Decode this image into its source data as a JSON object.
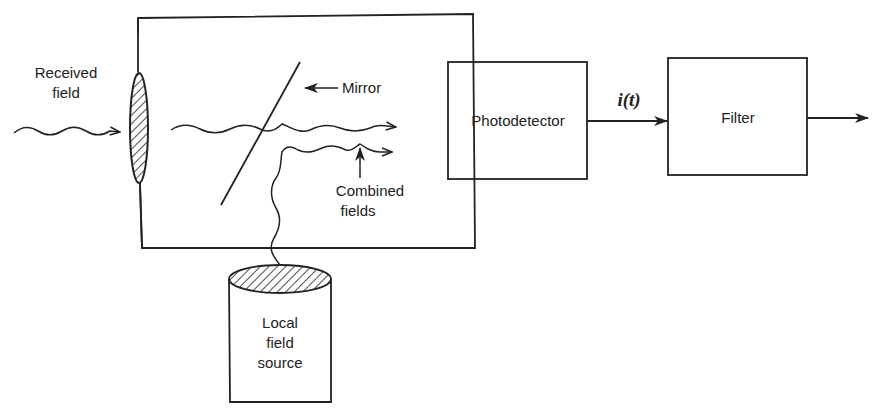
{
  "diagram": {
    "type": "block-diagram",
    "colors": {
      "line": "#222222",
      "background": "#ffffff"
    },
    "labels": {
      "received_field_line1": "Received",
      "received_field_line2": "field",
      "mirror": "Mirror",
      "combined_fields_line1": "Combined",
      "combined_fields_line2": "fields",
      "local_source_line1": "Local",
      "local_source_line2": "field",
      "local_source_line3": "source",
      "photodetector": "Photodetector",
      "signal": "i(t)",
      "filter": "Filter"
    },
    "blocks": [
      {
        "id": "mixer-enclosure",
        "label": ""
      },
      {
        "id": "photodetector",
        "label": "Photodetector"
      },
      {
        "id": "filter",
        "label": "Filter"
      },
      {
        "id": "local-field-source",
        "label": "Local field source"
      }
    ],
    "connections": [
      {
        "from": "received-field",
        "to": "lens",
        "style": "wavy-arrow"
      },
      {
        "from": "lens",
        "to": "mirror",
        "style": "wavy"
      },
      {
        "from": "mirror",
        "to": "photodetector",
        "style": "wavy-arrow",
        "label": ""
      },
      {
        "from": "local-field-source",
        "to": "mirror",
        "style": "wavy-arrow",
        "label": "Combined fields"
      },
      {
        "from": "photodetector",
        "to": "filter",
        "style": "arrow",
        "label": "i(t)"
      },
      {
        "from": "filter",
        "to": "output",
        "style": "arrow"
      }
    ]
  }
}
